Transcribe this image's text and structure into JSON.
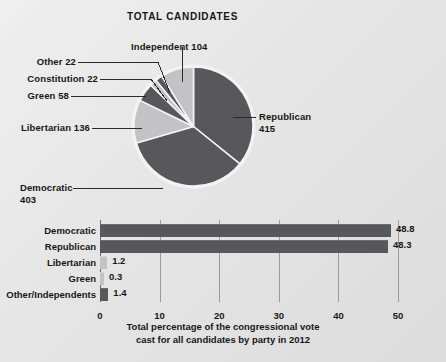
{
  "chart_data": [
    {
      "type": "pie",
      "title": "TOTAL CANDIDATES",
      "unit": "candidates",
      "start_angle_deg": 0,
      "direction": "clockwise",
      "total": 760,
      "categories": [
        "Republican",
        "Democratic",
        "Libertarian",
        "Green",
        "Constitution",
        "Other",
        "Independent"
      ],
      "values": [
        415,
        403,
        136,
        58,
        22,
        22,
        104
      ],
      "labels": [
        "Republican 415",
        "Democratic 403",
        "Libertarian 136",
        "Green 58",
        "Constitution 22",
        "Other 22",
        "Independent 104"
      ],
      "slice_colors": [
        "#58585c",
        "#58585c",
        "#c3c3c6",
        "#58585c",
        "#c3c3c6",
        "#58585c",
        "#c3c3c6"
      ],
      "legend": "none (direct labels with leader lines)",
      "grid": false
    },
    {
      "type": "bar",
      "orientation": "horizontal",
      "title": "",
      "xlabel": "Total percentage of the congressional vote cast for all candidates by party in 2012",
      "ylabel": "",
      "xlim": [
        0,
        52
      ],
      "xticks": [
        0,
        10,
        20,
        30,
        40,
        50
      ],
      "grid": true,
      "categories": [
        "Democratic",
        "Republican",
        "Libertarian",
        "Green",
        "Other/Independents"
      ],
      "values": [
        48.8,
        48.3,
        1.2,
        0.3,
        1.4
      ],
      "value_labels": [
        "48.8",
        "48.3",
        "1.2",
        "0.3",
        "1.4"
      ],
      "bar_colors": [
        "#58585c",
        "#58585c",
        "#c3c3c6",
        "#c3c3c6",
        "#58585c"
      ]
    }
  ],
  "pie": {
    "title": "TOTAL CANDIDATES",
    "slices": [
      {
        "name": "republican",
        "label": "Republican",
        "value_text": "415",
        "full": "Republican 415",
        "value": 415,
        "color": "#58585c"
      },
      {
        "name": "democratic",
        "label": "Democratic",
        "value_text": "403",
        "full": "Democratic 403",
        "value": 403,
        "color": "#58585c"
      },
      {
        "name": "libertarian",
        "label": "Libertarian",
        "value_text": "136",
        "full": "Libertarian 136",
        "value": 136,
        "color": "#c3c3c6"
      },
      {
        "name": "green",
        "label": "Green",
        "value_text": "58",
        "full": "Green 58",
        "value": 58,
        "color": "#58585c"
      },
      {
        "name": "constitution",
        "label": "Constitution",
        "value_text": "22",
        "full": "Constitution 22",
        "value": 22,
        "color": "#c3c3c6"
      },
      {
        "name": "other",
        "label": "Other",
        "value_text": "22",
        "full": "Other 22",
        "value": 22,
        "color": "#58585c"
      },
      {
        "name": "independent",
        "label": "Independent",
        "value_text": "104",
        "full": "Independent 104",
        "value": 104,
        "color": "#c3c3c6"
      }
    ],
    "callouts": {
      "independent": "Independent 104",
      "other": "Other 22",
      "constitution": "Constitution 22",
      "green": "Green 58",
      "libertarian": "Libertarian 136",
      "democratic_line1": "Democratic",
      "democratic_line2": "403",
      "republican_line1": "Republican",
      "republican_line2": "415"
    }
  },
  "bars": {
    "rows": [
      {
        "name": "democratic",
        "label": "Democratic",
        "value": 48.8,
        "value_text": "48.8",
        "color": "#58585c"
      },
      {
        "name": "republican",
        "label": "Republican",
        "value": 48.3,
        "value_text": "48.3",
        "color": "#58585c"
      },
      {
        "name": "libertarian",
        "label": "Libertarian",
        "value": 1.2,
        "value_text": "1.2",
        "color": "#c3c3c6"
      },
      {
        "name": "green",
        "label": "Green",
        "value": 0.3,
        "value_text": "0.3",
        "color": "#c3c3c6"
      },
      {
        "name": "other-independents",
        "label": "Other/Independents",
        "value": 1.4,
        "value_text": "1.4",
        "color": "#58585c"
      }
    ],
    "xticks": [
      "0",
      "10",
      "20",
      "30",
      "40",
      "50"
    ],
    "caption_line1": "Total percentage of the congressional vote",
    "caption_line2": "cast for all candidates by party in 2012"
  },
  "colors": {
    "dark_slice": "#58585c",
    "light_slice": "#c3c3c6",
    "background": "#e6e6e6",
    "text": "#171717",
    "gridline": "#9a9a9a"
  }
}
